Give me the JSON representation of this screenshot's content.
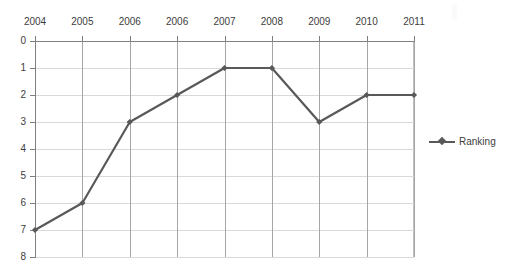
{
  "chart_data": {
    "type": "line",
    "title": "",
    "xlabel": "",
    "ylabel": "",
    "categories": [
      "2004",
      "2005",
      "2006",
      "2006",
      "2007",
      "2008",
      "2009",
      "2010",
      "2011"
    ],
    "series": [
      {
        "name": "Ranking",
        "values": [
          7,
          6,
          3,
          2,
          1,
          1,
          3,
          2,
          2
        ],
        "color": "#595959",
        "marker": "diamond"
      }
    ],
    "ylim": [
      0,
      8
    ],
    "y_inverted": true,
    "y_ticks": [
      "0",
      "1",
      "2",
      "3",
      "4",
      "5",
      "6",
      "7",
      "8"
    ],
    "grid": true,
    "legend_position": "right"
  },
  "legend": {
    "entries": [
      {
        "label": "Ranking",
        "color": "#595959"
      }
    ]
  },
  "colors": {
    "series": "#595959",
    "hgrid": "#d9d9d9",
    "vgrid": "#a6a6a6",
    "axis": "#808080",
    "text": "#3d3d3d",
    "background": "#ffffff"
  }
}
